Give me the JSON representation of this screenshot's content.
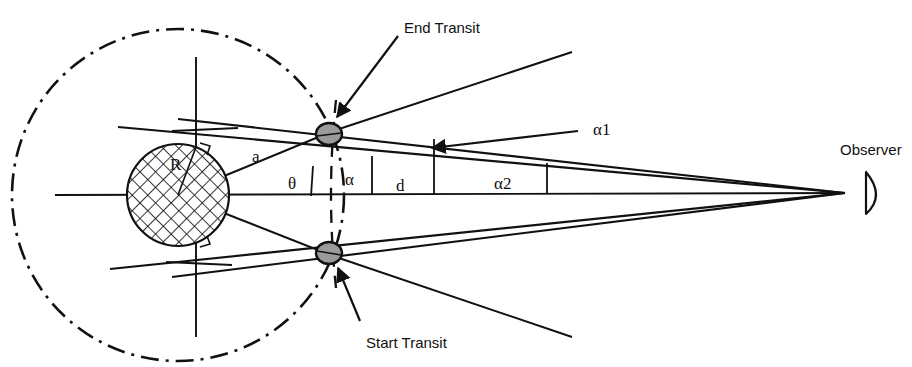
{
  "figure": {
    "kind": "transit-geometry-diagram",
    "background_color": "#ffffff",
    "stroke_color": "#111111",
    "planet_fill_color": "#9a9a9a",
    "star_hatch_color": "#111111"
  },
  "labels": {
    "end_transit": "End Transit",
    "start_transit": "Start Transit",
    "observer": "Observer",
    "alpha1": "α1",
    "alpha2": "α2",
    "alpha": "α",
    "theta": "θ",
    "semi_major_a": "a",
    "distance_d": "d",
    "star_radius_R": "R"
  },
  "geometry": {
    "star": {
      "cx": 178,
      "cy": 195,
      "r": 51
    },
    "orbit": {
      "cx": 178,
      "cy": 195,
      "r": 166
    },
    "observer_point": {
      "x": 845,
      "y": 193
    },
    "planet_end_transit": {
      "cx": 329,
      "cy": 134,
      "rx": 13,
      "ry": 11
    },
    "planet_start_transit": {
      "cx": 329,
      "cy": 253,
      "rx": 13,
      "ry": 11
    },
    "axis_line": {
      "x1": 55,
      "y1": 195,
      "x2": 845,
      "y2": 193
    },
    "tick_marks_x": [
      372,
      434,
      547
    ],
    "angle_labels_pos": {
      "theta": {
        "x": 293,
        "y": 188
      },
      "alpha": {
        "x": 352,
        "y": 184
      },
      "d": {
        "x": 399,
        "y": 190
      },
      "alpha2": {
        "x": 501,
        "y": 188
      },
      "alpha1": {
        "x": 593,
        "y": 135
      },
      "a": {
        "x": 256,
        "y": 160
      },
      "R": {
        "x": 176,
        "y": 167
      }
    }
  }
}
